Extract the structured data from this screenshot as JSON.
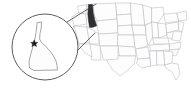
{
  "figure": {
    "width": 191,
    "height": 94,
    "background_color": "#ffffff"
  },
  "colors": {
    "state_fill": "#fdfdfd",
    "state_border": "#b9b9bd",
    "highlight_fill": "#2e2e30",
    "magnifier_border": "#4a4a4e",
    "magnifier_state_border": "#8a8a8f",
    "connector_line": "#3d3d41",
    "marker_color": "#1b1b1d"
  },
  "main_map": {
    "name": "united-states-map",
    "highlighted_state": "Idaho",
    "highlighted_state_abbr": "ID",
    "highlight_style": "solid dark fill",
    "state_count_visible": 48,
    "region": "contiguous United States"
  },
  "magnifier": {
    "name": "idaho-magnifier",
    "shape": "circle",
    "center_x": 45,
    "center_y": 47,
    "radius": 33,
    "magnified_subject": "Idaho",
    "marker": {
      "name": "location-star-marker",
      "symbol": "star",
      "x": 34,
      "y": 43
    },
    "connectors": [
      {
        "from_x": 67,
        "from_y": 22,
        "to_x": 96,
        "to_y": 4
      },
      {
        "from_x": 72,
        "from_y": 56,
        "to_x": 95,
        "to_y": 33
      }
    ]
  }
}
